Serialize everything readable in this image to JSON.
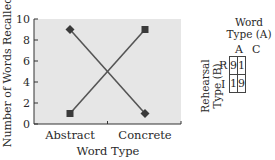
{
  "chart_data": {
    "type": "line",
    "title": "",
    "xlabel": "Word Type",
    "ylabel": "Number of Words Recalled",
    "categories": [
      "Abstract",
      "Concrete"
    ],
    "ylim": [
      0,
      10
    ],
    "yticks": [
      0,
      2,
      4,
      6,
      8,
      10
    ],
    "grid": false,
    "legend": "none",
    "series": [
      {
        "name": "Rehearsal R",
        "marker": "diamond",
        "values": [
          9,
          1
        ]
      },
      {
        "name": "Rehearsal I",
        "marker": "square",
        "values": [
          1,
          9
        ]
      }
    ],
    "colors": {
      "plot_bg": "#e6e6e6",
      "line": "#555555",
      "marker": "#3a3a3a"
    }
  },
  "table": {
    "title_line1": "Word",
    "title_line2": "Type (A)",
    "col_headers": [
      "A",
      "C"
    ],
    "row_title_line1": "Rehearsal",
    "row_title_line2": "Type (B)",
    "row_headers": [
      "R",
      "I"
    ],
    "cells": [
      [
        "9",
        "1"
      ],
      [
        "1",
        "9"
      ]
    ]
  }
}
